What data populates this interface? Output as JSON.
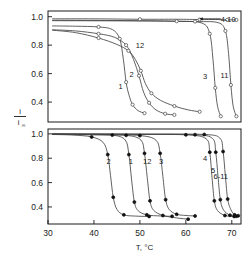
{
  "chart_data": {
    "type": "line",
    "title": "",
    "xlabel": "T, °C",
    "ylabel": "i / i∞",
    "ylabel_numerator": "i",
    "ylabel_denominator": "i",
    "ylabel_denominator_sub": "∞",
    "xlim": [
      30,
      72
    ],
    "ylim": [
      0.26,
      1.04
    ],
    "xticks": [
      30,
      40,
      50,
      60,
      70
    ],
    "xtick_labels": [
      "30",
      "40",
      "50",
      "60",
      "70"
    ],
    "yticks": [
      0.4,
      0.6,
      0.8,
      1.0
    ],
    "ytick_labels": [
      "0.4",
      "0.6",
      "0.8",
      "1.0"
    ],
    "grid": false,
    "legend_position": "inline-annotations",
    "panels": [
      {
        "name": "upper-panel",
        "marker": "open-circle",
        "ylim": [
          0.26,
          1.04
        ],
        "yticks": [
          0.4,
          0.6,
          0.8,
          1.0
        ],
        "ytick_labels": [
          "0.4",
          "0.6",
          "0.8",
          "1.0"
        ],
        "annotations": [
          {
            "label": "4-10",
            "x": 69.2,
            "y": 0.985,
            "arrow": true
          },
          {
            "label": "12",
            "x": 50.0,
            "y": 0.8
          },
          {
            "label": "2",
            "x": 48.2,
            "y": 0.6
          },
          {
            "label": "1",
            "x": 45.8,
            "y": 0.51
          },
          {
            "label": "3",
            "x": 64.2,
            "y": 0.58
          },
          {
            "label": "11",
            "x": 68.4,
            "y": 0.59
          }
        ],
        "series": [
          {
            "name": "4-10",
            "label": "4-10",
            "x": [
              31.0,
              40.0,
              50.0,
              58.0,
              63.0,
              66.5,
              69.0,
              70.2,
              71.0
            ],
            "y": [
              0.985,
              0.985,
              0.982,
              0.982,
              0.98,
              0.98,
              0.978,
              0.978,
              0.977
            ]
          },
          {
            "name": "1",
            "label": "1",
            "x": [
              31.0,
              36.0,
              41.0,
              44.0,
              45.6,
              46.4,
              47.0,
              47.6,
              48.4,
              49.6,
              51.0
            ],
            "y": [
              0.935,
              0.933,
              0.928,
              0.91,
              0.845,
              0.7,
              0.54,
              0.452,
              0.382,
              0.34,
              0.322
            ]
          },
          {
            "name": "2",
            "label": "2",
            "x": [
              31.0,
              36.0,
              41.0,
              44.5,
              47.0,
              48.6,
              49.8,
              50.8,
              52.0,
              53.5,
              55.5,
              57.5
            ],
            "y": [
              0.908,
              0.9,
              0.88,
              0.855,
              0.8,
              0.7,
              0.585,
              0.47,
              0.395,
              0.345,
              0.318,
              0.31
            ]
          },
          {
            "name": "12",
            "label": "12",
            "x": [
              31.0,
              36.0,
              41.0,
              45.0,
              47.5,
              49.0,
              50.2,
              51.2,
              52.5,
              54.5,
              57.5,
              60.5,
              63.0
            ],
            "y": [
              0.905,
              0.888,
              0.85,
              0.805,
              0.76,
              0.7,
              0.62,
              0.53,
              0.462,
              0.412,
              0.372,
              0.345,
              0.332
            ]
          },
          {
            "name": "3",
            "label": "3",
            "x": [
              31.0,
              45.0,
              58.0,
              63.5,
              65.2,
              65.9,
              66.4,
              66.9,
              67.6
            ],
            "y": [
              0.975,
              0.973,
              0.968,
              0.955,
              0.88,
              0.7,
              0.5,
              0.37,
              0.3
            ]
          },
          {
            "name": "11",
            "label": "11",
            "x": [
              31.0,
              50.0,
              62.0,
              67.0,
              68.6,
              69.3,
              69.8,
              70.3,
              71.0
            ],
            "y": [
              0.972,
              0.97,
              0.966,
              0.958,
              0.9,
              0.74,
              0.52,
              0.37,
              0.3
            ]
          }
        ]
      },
      {
        "name": "lower-panel",
        "marker": "filled-circle",
        "ylim": [
          0.26,
          1.04
        ],
        "yticks": [
          0.4,
          0.6,
          0.8,
          1.0
        ],
        "ytick_labels": [
          "0.4",
          "0.6",
          "0.8",
          "1.0"
        ],
        "annotations": [
          {
            "label": "2",
            "x": 43.2,
            "y": 0.78
          },
          {
            "label": "1",
            "x": 48.0,
            "y": 0.78
          },
          {
            "label": "12",
            "x": 51.6,
            "y": 0.78
          },
          {
            "label": "3",
            "x": 54.6,
            "y": 0.78
          },
          {
            "label": "4",
            "x": 64.2,
            "y": 0.8
          },
          {
            "label": "5",
            "x": 65.9,
            "y": 0.7
          },
          {
            "label": "6-11",
            "x": 67.6,
            "y": 0.655
          }
        ],
        "series": [
          {
            "name": "2",
            "label": "2",
            "x": [
              31.0,
              35.5,
              39.5,
              42.0,
              43.0,
              43.6,
              44.2,
              45.0,
              46.5,
              49.0,
              52.0
            ],
            "y": [
              0.995,
              0.99,
              0.975,
              0.93,
              0.83,
              0.66,
              0.48,
              0.38,
              0.335,
              0.325,
              0.322
            ]
          },
          {
            "name": "1",
            "label": "1",
            "x": [
              31.0,
              38.0,
              44.0,
              46.8,
              47.6,
              48.2,
              48.8,
              49.6,
              51.5,
              54.5,
              57.0
            ],
            "y": [
              0.998,
              0.995,
              0.99,
              0.95,
              0.83,
              0.62,
              0.44,
              0.37,
              0.335,
              0.326,
              0.323
            ]
          },
          {
            "name": "12",
            "label": "12",
            "x": [
              31.0,
              40.0,
              47.0,
              50.2,
              51.0,
              51.6,
              52.2,
              53.0,
              55.0,
              58.0,
              60.5
            ],
            "y": [
              0.997,
              0.993,
              0.988,
              0.95,
              0.84,
              0.64,
              0.45,
              0.372,
              0.33,
              0.31,
              0.3
            ]
          },
          {
            "name": "3",
            "label": "3",
            "x": [
              31.0,
              42.0,
              50.0,
              53.5,
              54.4,
              55.0,
              55.6,
              56.4,
              58.0,
              60.0,
              62.0
            ],
            "y": [
              0.996,
              0.992,
              0.986,
              0.948,
              0.84,
              0.65,
              0.46,
              0.378,
              0.34,
              0.33,
              0.326
            ]
          },
          {
            "name": "4",
            "label": "4",
            "x": [
              31.0,
              48.0,
              60.0,
              64.4,
              65.2,
              65.7,
              66.2,
              66.9,
              68.5,
              70.5
            ],
            "y": [
              0.999,
              0.996,
              0.992,
              0.96,
              0.85,
              0.64,
              0.45,
              0.37,
              0.33,
              0.322
            ]
          },
          {
            "name": "5",
            "label": "5",
            "x": [
              31.0,
              50.0,
              62.0,
              65.8,
              66.5,
              67.0,
              67.5,
              68.2,
              69.6,
              71.0
            ],
            "y": [
              0.999,
              0.997,
              0.993,
              0.962,
              0.85,
              0.65,
              0.46,
              0.375,
              0.332,
              0.324
            ]
          },
          {
            "name": "6-11",
            "label": "6-11",
            "x": [
              31.0,
              52.0,
              64.0,
              67.4,
              68.1,
              68.6,
              69.1,
              69.8,
              70.6,
              71.4
            ],
            "y": [
              1.0,
              0.998,
              0.995,
              0.965,
              0.855,
              0.655,
              0.465,
              0.378,
              0.335,
              0.328
            ]
          }
        ]
      }
    ]
  },
  "axes": {
    "x_title": "T, °C",
    "x_tick_labels": [
      "30",
      "40",
      "50",
      "60",
      "70"
    ],
    "upper_y_tick_labels": [
      "1.0",
      "0.8",
      "0.6",
      "0.4"
    ],
    "lower_y_tick_labels": [
      "1.0",
      "0.8",
      "0.6",
      "0.4"
    ],
    "y_title_numerator": "i",
    "y_title_denominator": "i",
    "y_title_denominator_subscript": "∞"
  },
  "colors": {
    "ink": "#1a1a1a",
    "curve": "#444444",
    "marker_open_fill": "#ffffff",
    "marker_filled": "#111111",
    "background": "#ffffff"
  }
}
